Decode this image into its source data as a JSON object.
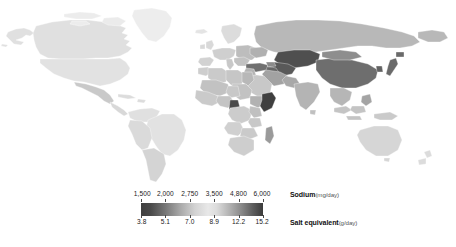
{
  "figure": {
    "type": "choropleth-world-map",
    "background_color": "#ffffff"
  },
  "legend": {
    "bar": {
      "x": 141,
      "y": 203,
      "width": 122,
      "height": 13,
      "gradient_stops": [
        {
          "pos": 0,
          "color": "#3f3f3f"
        },
        {
          "pos": 8,
          "color": "#4a4a4a"
        },
        {
          "pos": 20,
          "color": "#777777"
        },
        {
          "pos": 32,
          "color": "#a8a8a8"
        },
        {
          "pos": 44,
          "color": "#d2d2d2"
        },
        {
          "pos": 55,
          "color": "#e8e8e8"
        },
        {
          "pos": 62,
          "color": "#dcdcdc"
        },
        {
          "pos": 72,
          "color": "#b4b4b4"
        },
        {
          "pos": 82,
          "color": "#8a8a8a"
        },
        {
          "pos": 92,
          "color": "#5c5c5c"
        },
        {
          "pos": 100,
          "color": "#3c3c3c"
        }
      ]
    },
    "sodium": {
      "label_strong": "Sodium",
      "label_unit": "(mg/day)",
      "ticks": [
        {
          "value": "1,500",
          "pos": 0
        },
        {
          "value": "2,000",
          "pos": 20
        },
        {
          "value": "2,750",
          "pos": 40
        },
        {
          "value": "3,500",
          "pos": 60
        },
        {
          "value": "4,800",
          "pos": 80
        },
        {
          "value": "6,000",
          "pos": 100
        }
      ]
    },
    "salt_equivalent": {
      "label_strong": "Salt equivalent",
      "label_unit": "(g/day)",
      "ticks": [
        {
          "value": "3.8",
          "pos": 0
        },
        {
          "value": "5.1",
          "pos": 20
        },
        {
          "value": "7.0",
          "pos": 40
        },
        {
          "value": "8.9",
          "pos": 60
        },
        {
          "value": "12.2",
          "pos": 80
        },
        {
          "value": "15.2",
          "pos": 100
        }
      ]
    }
  },
  "chart_data": {
    "type": "heatmap",
    "title": "",
    "xlabel": "",
    "ylabel": "",
    "grid": false,
    "legend_position": "bottom",
    "colorbar": {
      "primary_scale": {
        "name": "Sodium",
        "unit": "mg/day",
        "tick_values": [
          1500,
          2000,
          2750,
          3500,
          4800,
          6000
        ],
        "tick_labels": [
          "1,500",
          "2,000",
          "2,750",
          "3,500",
          "4,800",
          "6,000"
        ],
        "range": [
          1500,
          6000
        ]
      },
      "secondary_scale": {
        "name": "Salt equivalent",
        "unit": "g/day",
        "tick_values": [
          3.8,
          5.1,
          7.0,
          8.9,
          12.2,
          15.2
        ],
        "tick_labels": [
          "3.8",
          "5.1",
          "7.0",
          "8.9",
          "12.2",
          "15.2"
        ],
        "range": [
          3.8,
          15.2
        ]
      },
      "colormap_note": "diverging grayscale: dark at low end, light mid, dark at high end"
    },
    "shading_bins": [
      {
        "bin": "1,500-2,000",
        "color": "#4d4d4d"
      },
      {
        "bin": "2,000-2,750",
        "color": "#8f8f8f"
      },
      {
        "bin": "2,750-3,500",
        "color": "#d8d8d8"
      },
      {
        "bin": "3,500-4,800",
        "color": "#9a9a9a"
      },
      {
        "bin": "4,800-6,000",
        "color": "#4a4a4a"
      }
    ],
    "regions": [
      {
        "name": "Canada",
        "shade": "#e0e0e0"
      },
      {
        "name": "United States",
        "shade": "#e2e2e2"
      },
      {
        "name": "Greenland",
        "shade": "#ededed"
      },
      {
        "name": "Mexico",
        "shade": "#c9c9c9"
      },
      {
        "name": "Central America",
        "shade": "#d8d8d8"
      },
      {
        "name": "Caribbean",
        "shade": "#dcdcdc"
      },
      {
        "name": "Brazil",
        "shade": "#e2e2e2"
      },
      {
        "name": "Argentina",
        "shade": "#d4d4d4"
      },
      {
        "name": "Chile",
        "shade": "#cccccc"
      },
      {
        "name": "Peru",
        "shade": "#dadada"
      },
      {
        "name": "Colombia",
        "shade": "#e0e0e0"
      },
      {
        "name": "Venezuela",
        "shade": "#dedede"
      },
      {
        "name": "United Kingdom",
        "shade": "#d9d9d9"
      },
      {
        "name": "France",
        "shade": "#cfcfcf"
      },
      {
        "name": "Spain",
        "shade": "#d2d2d2"
      },
      {
        "name": "Germany",
        "shade": "#c4c4c4"
      },
      {
        "name": "Italy",
        "shade": "#c8c8c8"
      },
      {
        "name": "Poland",
        "shade": "#bdbdbd"
      },
      {
        "name": "Scandinavia",
        "shade": "#dcdcdc"
      },
      {
        "name": "Ukraine",
        "shade": "#b0b0b0"
      },
      {
        "name": "Russia",
        "shade": "#b8b8b8"
      },
      {
        "name": "Kazakhstan",
        "shade": "#4f4f4f"
      },
      {
        "name": "Uzbekistan",
        "shade": "#595959"
      },
      {
        "name": "Turkmenistan",
        "shade": "#666666"
      },
      {
        "name": "Turkey",
        "shade": "#707070"
      },
      {
        "name": "Iran",
        "shade": "#a2a2a2"
      },
      {
        "name": "Saudi Arabia",
        "shade": "#c8c8c8"
      },
      {
        "name": "India",
        "shade": "#b4b4b4"
      },
      {
        "name": "China",
        "shade": "#6e6e6e"
      },
      {
        "name": "Mongolia",
        "shade": "#8e8e8e"
      },
      {
        "name": "Japan",
        "shade": "#6a6a6a"
      },
      {
        "name": "South Korea",
        "shade": "#626262"
      },
      {
        "name": "Southeast Asia",
        "shade": "#b6b6b6"
      },
      {
        "name": "Indonesia",
        "shade": "#c4c4c4"
      },
      {
        "name": "Australia",
        "shade": "#d6d6d6"
      },
      {
        "name": "New Zealand",
        "shade": "#dcdcdc"
      },
      {
        "name": "Egypt",
        "shade": "#b8b8b8"
      },
      {
        "name": "Libya",
        "shade": "#c6c6c6"
      },
      {
        "name": "Algeria",
        "shade": "#cacaca"
      },
      {
        "name": "Nigeria",
        "shade": "#c4c4c4"
      },
      {
        "name": "Cameroon",
        "shade": "#4a4a4a"
      },
      {
        "name": "Ethiopia",
        "shade": "#b2b2b2"
      },
      {
        "name": "Somalia",
        "shade": "#3f3f3f"
      },
      {
        "name": "Kenya",
        "shade": "#c0c0c0"
      },
      {
        "name": "Tanzania",
        "shade": "#c8c8c8"
      },
      {
        "name": "Madagascar",
        "shade": "#9a9a9a"
      },
      {
        "name": "South Africa",
        "shade": "#cecece"
      },
      {
        "name": "Angola",
        "shade": "#d0d0d0"
      },
      {
        "name": "DR Congo",
        "shade": "#cccccc"
      },
      {
        "name": "Sudan",
        "shade": "#c2c2c2"
      }
    ]
  }
}
